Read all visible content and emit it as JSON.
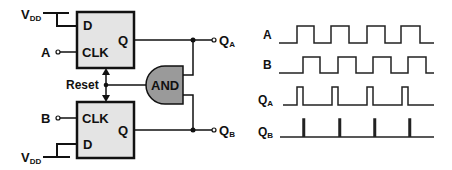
{
  "colors": {
    "stroke": "#111111",
    "flipflop_fill": "#e4e4e4",
    "and_fill": "#9a9a9a",
    "background": "#ffffff"
  },
  "circuit": {
    "top_flipflop": {
      "d_label": "D",
      "clk_label": "CLK",
      "q_label": "Q",
      "supply_label": "V",
      "supply_sub": "DD",
      "clock_input_label": "A"
    },
    "bottom_flipflop": {
      "d_label": "D",
      "clk_label": "CLK",
      "q_label": "Q",
      "supply_label": "V",
      "supply_sub": "DD",
      "clock_input_label": "B"
    },
    "and_gate_label": "AND",
    "reset_label": "Reset",
    "output_a": {
      "label": "Q",
      "sub": "A"
    },
    "output_b": {
      "label": "Q",
      "sub": "B"
    }
  },
  "timing": {
    "signals": [
      {
        "name": "A",
        "sub": "",
        "type": "square"
      },
      {
        "name": "B",
        "sub": "",
        "type": "square"
      },
      {
        "name": "Q",
        "sub": "A",
        "type": "pulse"
      },
      {
        "name": "Q",
        "sub": "B",
        "type": "spike"
      }
    ]
  }
}
